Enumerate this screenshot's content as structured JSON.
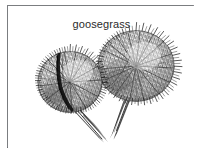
{
  "figure": {
    "caption": "goosegrass",
    "medium": "ink line drawing",
    "background_color": "#ffffff",
    "ink_color": "#1a1a1a",
    "frame_color": "#7b7d80",
    "canvas": {
      "width": 206,
      "height": 156
    },
    "frame": {
      "x": 7,
      "y": 5,
      "width": 187,
      "height": 143
    },
    "specimens": [
      {
        "id": "left-burr",
        "label": "left goosegrass burr",
        "head_center_x": 62,
        "head_center_y": 76,
        "head_radius_x": 33,
        "head_radius_y": 31,
        "stem_angle_deg": 58,
        "stem_length": 48,
        "has_split_seam": true
      },
      {
        "id": "right-burr",
        "label": "right goosegrass burr",
        "head_center_x": 128,
        "head_center_y": 60,
        "head_radius_x": 39,
        "head_radius_y": 36,
        "stem_angle_deg": 108,
        "stem_length": 58,
        "has_split_seam": false
      }
    ],
    "icon_names": [
      "burr-seedhead-icon",
      "stem-icon",
      "spine-texture-icon"
    ]
  }
}
